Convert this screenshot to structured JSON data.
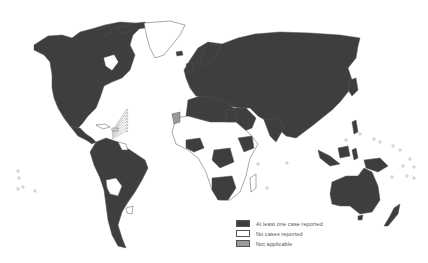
{
  "map": {
    "type": "world choropleth",
    "colors": {
      "reported": "#3e3e3e",
      "no_cases": "#ffffff",
      "not_applicable": "#9a9a9a",
      "border": "#555555",
      "background": "#ffffff"
    }
  },
  "legend": {
    "items": [
      {
        "key": "reported",
        "label": "At least one case reported",
        "color": "#3e3e3e"
      },
      {
        "key": "no_cases",
        "label": "No cases reported",
        "color": "#ffffff"
      },
      {
        "key": "not_applicable",
        "label": "Not applicable",
        "color": "#9a9a9a"
      }
    ]
  }
}
